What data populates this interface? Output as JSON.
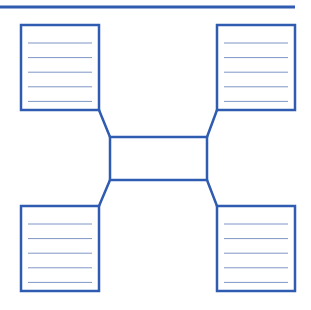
{
  "diagram": {
    "type": "graphic-organizer",
    "colors": {
      "border": "#2f5cb0",
      "rule_line": "#7f96c6",
      "background": "#ffffff"
    },
    "top_rule": {
      "x1": 0,
      "y1": 7,
      "x2": 295,
      "y2": 7
    },
    "center_box": {
      "x": 110,
      "y": 137,
      "width": 97,
      "height": 43,
      "text": ""
    },
    "note_boxes": [
      {
        "id": "top-left",
        "x": 21,
        "y": 25,
        "width": 78,
        "height": 85,
        "lines": 5,
        "text": ""
      },
      {
        "id": "top-right",
        "x": 217,
        "y": 25,
        "width": 78,
        "height": 85,
        "lines": 5,
        "text": ""
      },
      {
        "id": "bottom-left",
        "x": 21,
        "y": 206,
        "width": 78,
        "height": 85,
        "lines": 5,
        "text": ""
      },
      {
        "id": "bottom-right",
        "x": 217,
        "y": 206,
        "width": 78,
        "height": 85,
        "lines": 5,
        "text": ""
      }
    ],
    "connectors": [
      {
        "from": "top-left",
        "x1": 99,
        "y1": 110,
        "x2": 110,
        "y2": 137
      },
      {
        "from": "top-right",
        "x1": 217,
        "y1": 110,
        "x2": 207,
        "y2": 137
      },
      {
        "from": "bottom-left",
        "x1": 99,
        "y1": 206,
        "x2": 110,
        "y2": 180
      },
      {
        "from": "bottom-right",
        "x1": 217,
        "y1": 206,
        "x2": 207,
        "y2": 180
      }
    ]
  }
}
